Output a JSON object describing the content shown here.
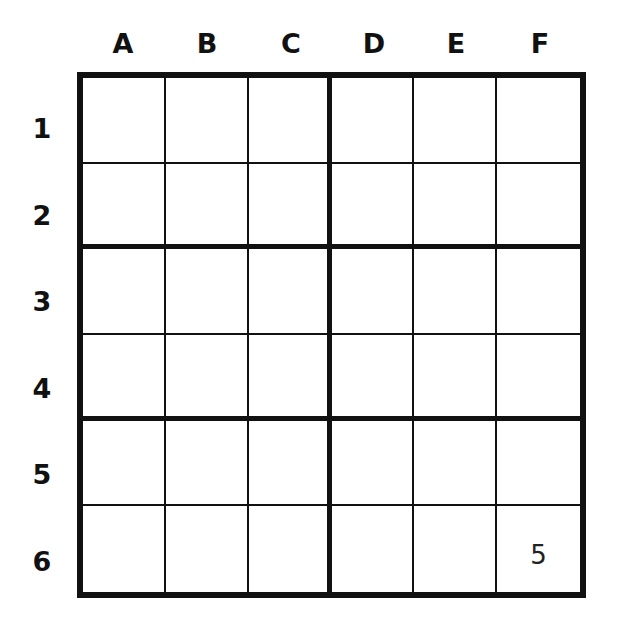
{
  "puzzle": {
    "columns": [
      "A",
      "B",
      "C",
      "D",
      "E",
      "F"
    ],
    "rows": [
      "1",
      "2",
      "3",
      "4",
      "5",
      "6"
    ],
    "cells": [
      [
        "",
        "",
        "",
        "",
        "",
        ""
      ],
      [
        "",
        "",
        "",
        "",
        "",
        ""
      ],
      [
        "",
        "",
        "",
        "",
        "",
        ""
      ],
      [
        "",
        "",
        "",
        "",
        "",
        ""
      ],
      [
        "",
        "",
        "",
        "",
        "",
        ""
      ],
      [
        "",
        "",
        "",
        "",
        "",
        "5"
      ]
    ],
    "box_size": {
      "rows": 2,
      "cols": 3
    },
    "colors": {
      "line": "#111111",
      "background": "#ffffff",
      "given_digit": "#222222"
    }
  }
}
